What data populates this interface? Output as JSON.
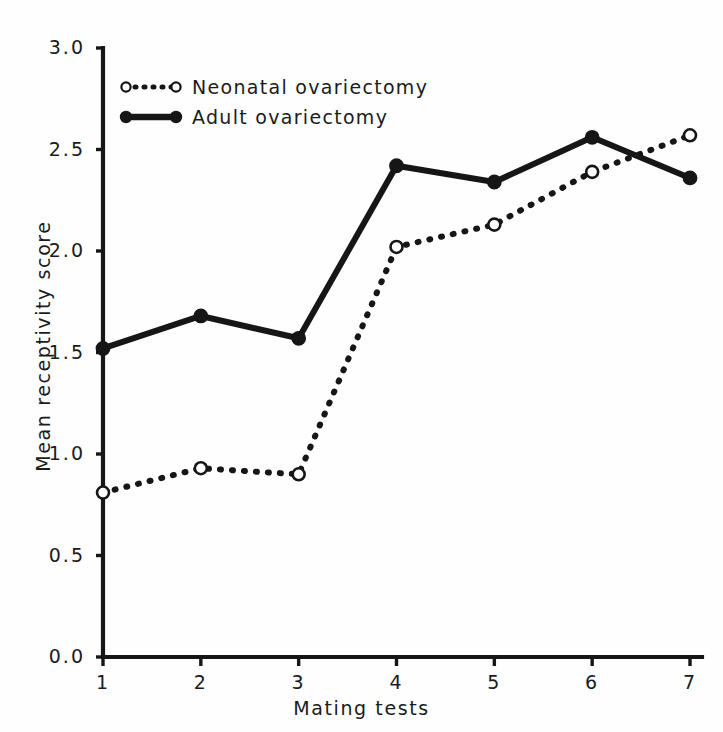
{
  "chart_data": {
    "type": "line",
    "title": "",
    "xlabel": "Mating tests",
    "ylabel": "Mean receptivity score",
    "x": [
      1,
      2,
      3,
      4,
      5,
      6,
      7
    ],
    "xticklabels": [
      "1",
      "2",
      "3",
      "4",
      "5",
      "6",
      "7"
    ],
    "yticklabels": [
      "0.0",
      "0.5",
      "1.0",
      "1.5",
      "2.0",
      "2.5",
      "3.0"
    ],
    "yticks": [
      0.0,
      0.5,
      1.0,
      1.5,
      2.0,
      2.5,
      3.0
    ],
    "xlim": [
      1,
      7
    ],
    "ylim": [
      0.0,
      3.0
    ],
    "grid": false,
    "legend_position": "upper-left-inside",
    "series": [
      {
        "name": "Neonatal ovariectomy",
        "marker": "open-circle",
        "linestyle": "dotted",
        "color": "#161616",
        "values": [
          0.81,
          0.93,
          0.9,
          2.02,
          2.13,
          2.39,
          2.57
        ]
      },
      {
        "name": "Adult ovariectomy",
        "marker": "filled-circle",
        "linestyle": "solid",
        "color": "#161616",
        "values": [
          1.52,
          1.68,
          1.57,
          2.42,
          2.34,
          2.56,
          2.36
        ]
      }
    ]
  },
  "axes": {
    "x_title": "Mating tests",
    "y_title": "Mean receptivity score",
    "y_labels": [
      "3.0",
      "2.5",
      "2.0",
      "1.5",
      "1.0",
      "0.5",
      "0.0"
    ],
    "x_labels": [
      "1",
      "2",
      "3",
      "4",
      "5",
      "6",
      "7"
    ]
  },
  "legend": {
    "items": [
      {
        "label": "Neonatal ovariectomy"
      },
      {
        "label": "Adult ovariectomy"
      }
    ]
  },
  "colors": {
    "ink": "#161616",
    "background": "#fefefe"
  }
}
